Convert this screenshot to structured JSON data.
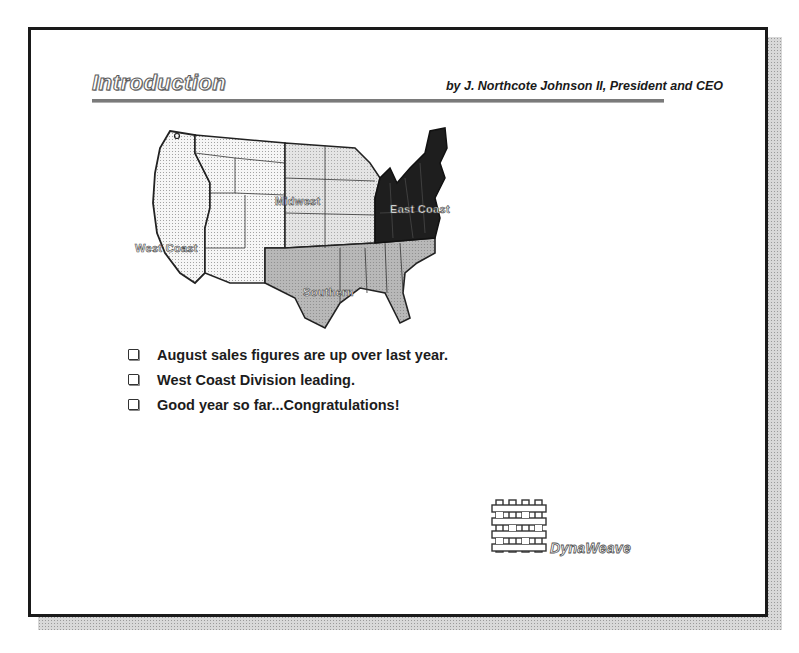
{
  "slide": {
    "title": "Introduction",
    "byline": "by J. Northcote Johnson II, President and CEO",
    "map": {
      "regions": [
        {
          "name": "West Coast",
          "label": "West Coast",
          "fill": "#f2f2f2"
        },
        {
          "name": "Midwest",
          "label": "Midwest",
          "fill": "#e2e2e2"
        },
        {
          "name": "East Coast",
          "label": "East Coast",
          "fill": "#1e1e1e"
        },
        {
          "name": "Southern",
          "label": "Southern",
          "fill": "#b4b4b4"
        }
      ]
    },
    "bullets": [
      "August sales figures are up over last year.",
      "West Coast Division leading.",
      "Good year so far...Congratulations!"
    ],
    "logo": {
      "name": "DynaWeave",
      "icon": "woven-grid-icon"
    }
  },
  "colors": {
    "frame": "#1a1a1a",
    "shadow": "#c8c8c8",
    "rule": "#7a7a7a",
    "text": "#1c1c1c"
  }
}
